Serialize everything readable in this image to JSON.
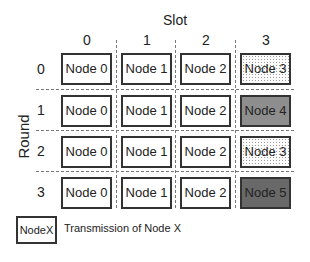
{
  "diagram": {
    "title": "Slot",
    "y_axis_title": "Round",
    "columns": [
      "0",
      "1",
      "2",
      "3"
    ],
    "rows": [
      {
        "label": "0",
        "cells": [
          {
            "text": "Node 0",
            "fill": "none"
          },
          {
            "text": "Node 1",
            "fill": "none"
          },
          {
            "text": "Node 2",
            "fill": "none"
          },
          {
            "text": "Node 3",
            "fill": "dotted"
          }
        ]
      },
      {
        "label": "1",
        "cells": [
          {
            "text": "Node 0",
            "fill": "none"
          },
          {
            "text": "Node 1",
            "fill": "none"
          },
          {
            "text": "Node 2",
            "fill": "none"
          },
          {
            "text": "Node 4",
            "fill": "gray"
          }
        ]
      },
      {
        "label": "2",
        "cells": [
          {
            "text": "Node 0",
            "fill": "none"
          },
          {
            "text": "Node 1",
            "fill": "none"
          },
          {
            "text": "Node 2",
            "fill": "none"
          },
          {
            "text": "Node 3",
            "fill": "dotted"
          }
        ]
      },
      {
        "label": "3",
        "cells": [
          {
            "text": "Node 0",
            "fill": "none"
          },
          {
            "text": "Node 1",
            "fill": "none"
          },
          {
            "text": "Node 2",
            "fill": "none"
          },
          {
            "text": "Node 5",
            "fill": "dark"
          }
        ]
      }
    ],
    "legend": {
      "box_label": "NodeX",
      "description": "Transmission of Node X"
    }
  }
}
